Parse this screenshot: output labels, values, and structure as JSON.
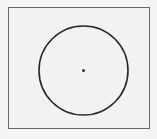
{
  "diagram": {
    "frame": {
      "x": 8,
      "y": 7,
      "width": 142,
      "height": 122,
      "stroke": "#6a6a6a"
    },
    "circle": {
      "cx": 83.5,
      "cy": 70.5,
      "r": 44.5,
      "stroke": "#2a2a2a",
      "stroke_width": 1.6
    },
    "center_point": {
      "x": 83.5,
      "y": 70.5,
      "size": 1.5,
      "color": "#333333"
    }
  }
}
